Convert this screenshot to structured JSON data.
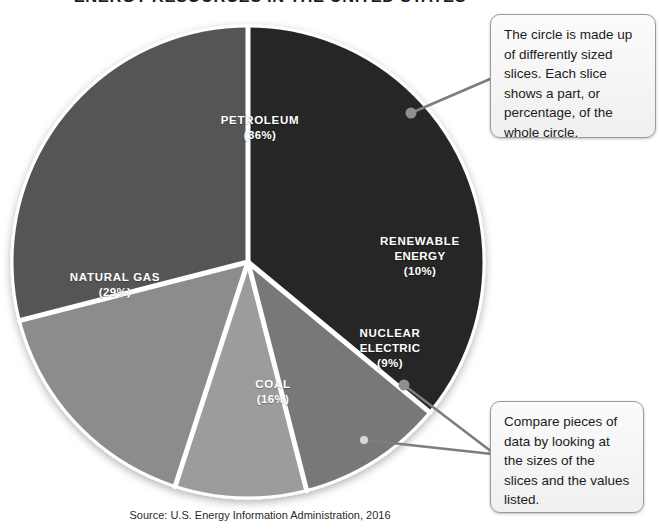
{
  "chart_data": {
    "type": "pie",
    "title": "ENERGY RESOURCES IN THE UNITED STATES",
    "source": "Source: U.S. Energy Information Administration, 2016",
    "units": "percent",
    "legend": "none (slices labeled in place)",
    "grid": false,
    "categories": [
      "PETROLEUM",
      "NATURAL GAS",
      "COAL",
      "NUCLEAR ELECTRIC",
      "RENEWABLE ENERGY"
    ],
    "values": [
      36,
      29,
      16,
      9,
      10
    ],
    "slices": [
      {
        "name": "PETROLEUM",
        "label": "PETROLEUM",
        "value": 36,
        "value_label": "(36%)",
        "color": "#262626",
        "start_angle_deg": 0,
        "end_angle_deg": 129.6
      },
      {
        "name": "RENEWABLE ENERGY",
        "label": "RENEWABLE\nENERGY",
        "label_line1": "RENEWABLE",
        "label_line2": "ENERGY",
        "value": 10,
        "value_label": "(10%)",
        "color": "#787878",
        "start_angle_deg": 129.6,
        "end_angle_deg": 165.6
      },
      {
        "name": "NUCLEAR ELECTRIC",
        "label": "NUCLEAR\nELECTRIC",
        "label_line1": "NUCLEAR",
        "label_line2": "ELECTRIC",
        "value": 9,
        "value_label": "(9%)",
        "color": "#9c9c9c",
        "start_angle_deg": 165.6,
        "end_angle_deg": 198.0
      },
      {
        "name": "COAL",
        "label": "COAL",
        "value": 16,
        "value_label": "(16%)",
        "color": "#8c8c8c",
        "start_angle_deg": 198.0,
        "end_angle_deg": 255.6
      },
      {
        "name": "NATURAL GAS",
        "label": "NATURAL GAS",
        "value": 29,
        "value_label": "(29%)",
        "color": "#555555",
        "start_angle_deg": 255.6,
        "end_angle_deg": 360
      }
    ]
  },
  "title": {
    "text": "ENERGY RESOURCES IN THE UNITED STATES"
  },
  "labels": {
    "petroleum": {
      "name": "PETROLEUM",
      "pct": "(36%)"
    },
    "natural_gas": {
      "name": "NATURAL GAS",
      "pct": "(29%)"
    },
    "renewable": {
      "line1": "RENEWABLE",
      "line2": "ENERGY",
      "pct": "(10%)"
    },
    "nuclear": {
      "line1": "NUCLEAR",
      "line2": "ELECTRIC",
      "pct": "(9%)"
    },
    "coal": {
      "name": "COAL",
      "pct": "(16%)"
    }
  },
  "callouts": {
    "top": {
      "text": "The circle is made up of differently sized slices. Each slice shows a part, or percentage, of the whole circle."
    },
    "bottom": {
      "text": "Compare pieces of data by looking at the sizes of the slices and the values listed."
    }
  },
  "source": {
    "text": "Source: U.S. Energy Information Administration, 2016"
  },
  "colors": {
    "petroleum": "#262626",
    "natural_gas": "#555555",
    "coal": "#8c8c8c",
    "nuclear": "#9c9c9c",
    "renewable": "#787878",
    "slice_divider": "#ffffff",
    "callout_border": "#9a9a9a",
    "connector": "#7d7d7d"
  }
}
